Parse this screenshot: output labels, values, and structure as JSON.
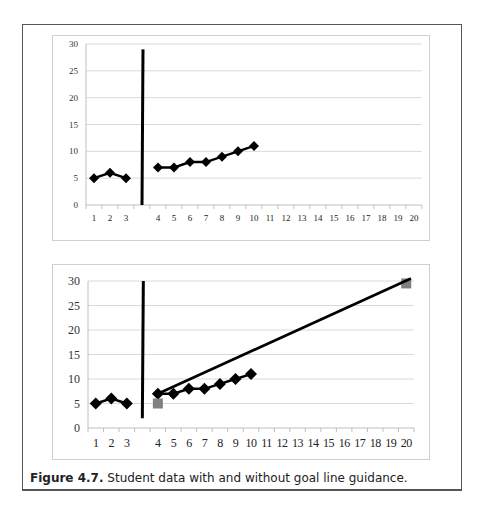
{
  "caption": {
    "label": "Figure 4.7.",
    "text": " Student data with and without goal line guidance."
  },
  "colors": {
    "data": "#000000",
    "goal_marker": "#808080",
    "grid": "#d9d9d9",
    "axis": "#bfbfbf"
  },
  "chart_data": [
    {
      "type": "line",
      "title": "",
      "xlabel": "",
      "ylabel": "",
      "ylim": [
        0,
        30
      ],
      "yticks": [
        0,
        5,
        10,
        15,
        20,
        25,
        30
      ],
      "categories": [
        "1",
        "2",
        "3",
        "",
        "4",
        "5",
        "6",
        "7",
        "8",
        "9",
        "10",
        "11",
        "12",
        "13",
        "14",
        "15",
        "16",
        "17",
        "18",
        "19",
        "20"
      ],
      "grid": true,
      "legend": "none",
      "phase_change_line": {
        "between": [
          "3",
          "4"
        ],
        "from": 0,
        "to": 29
      },
      "series": [
        {
          "name": "Baseline",
          "x": [
            "1",
            "2",
            "3"
          ],
          "values": [
            5,
            6,
            5
          ],
          "marker": "diamond"
        },
        {
          "name": "Intervention",
          "x": [
            "4",
            "5",
            "6",
            "7",
            "8",
            "9",
            "10"
          ],
          "values": [
            7,
            7,
            8,
            8,
            9,
            10,
            11
          ],
          "marker": "diamond"
        }
      ]
    },
    {
      "type": "line",
      "title": "",
      "xlabel": "",
      "ylabel": "",
      "ylim": [
        0,
        30
      ],
      "yticks": [
        0,
        5,
        10,
        15,
        20,
        25,
        30
      ],
      "categories": [
        "1",
        "2",
        "3",
        "",
        "4",
        "5",
        "6",
        "7",
        "8",
        "9",
        "10",
        "11",
        "12",
        "13",
        "14",
        "15",
        "16",
        "17",
        "18",
        "19",
        "20"
      ],
      "grid": true,
      "legend": "none",
      "phase_change_line": {
        "between": [
          "3",
          "4"
        ],
        "from": 2,
        "to": 30
      },
      "series": [
        {
          "name": "Baseline",
          "x": [
            "1",
            "2",
            "3"
          ],
          "values": [
            5,
            6,
            5
          ],
          "marker": "diamond"
        },
        {
          "name": "Intervention",
          "x": [
            "4",
            "5",
            "6",
            "7",
            "8",
            "9",
            "10"
          ],
          "values": [
            7,
            7,
            8,
            8,
            9,
            10,
            11
          ],
          "marker": "diamond"
        },
        {
          "name": "Goal markers",
          "x": [
            "4",
            "20"
          ],
          "values": [
            5,
            29.5
          ],
          "marker": "square",
          "line": false
        },
        {
          "name": "Goal line",
          "x": [
            "4",
            "20"
          ],
          "values": [
            7,
            30.5
          ],
          "marker": "none"
        }
      ]
    }
  ]
}
